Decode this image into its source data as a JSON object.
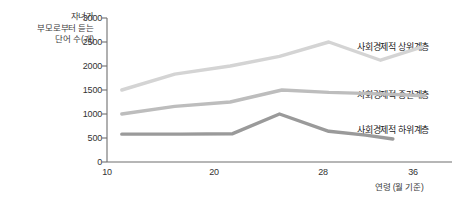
{
  "chart_data": {
    "type": "line",
    "title": "",
    "xlabel": "연령 (월 기준)",
    "ylabel": "자녀가\n부모로부터 듣는\n단어 수(개)",
    "xlim": [
      10,
      38
    ],
    "ylim": [
      0,
      3000
    ],
    "xticks": [
      "10",
      "20",
      "28",
      "36"
    ],
    "xtick_values": [
      10,
      20,
      28,
      36
    ],
    "yticks": [
      "0",
      "500",
      "1000",
      "1500",
      "2000",
      "2500",
      "3000"
    ],
    "ytick_values": [
      0,
      500,
      1000,
      1500,
      2000,
      2500,
      3000
    ],
    "grid": false,
    "legend_position": "right-inline",
    "series": [
      {
        "name": "사회경제적 상위계층",
        "color": "#d4d4d4",
        "x": [
          11.2,
          15.5,
          20.0,
          24.0,
          28.0,
          32.2,
          35.6
        ],
        "values": [
          1500,
          1830,
          2000,
          2200,
          2500,
          2120,
          2400
        ]
      },
      {
        "name": "사회경제적 중간계층",
        "color": "#bdbdbd",
        "x": [
          11.2,
          15.5,
          20.0,
          24.2,
          28.0,
          32.2,
          35.8
        ],
        "values": [
          1000,
          1160,
          1250,
          1500,
          1450,
          1420,
          1380
        ]
      },
      {
        "name": "사회경제적 하위계층",
        "color": "#9a9a9a",
        "x": [
          11.2,
          16.0,
          20.2,
          24.0,
          28.0,
          31.0,
          33.2
        ],
        "values": [
          580,
          580,
          590,
          1000,
          640,
          560,
          480
        ]
      }
    ]
  },
  "axes": {
    "y_title": "자녀가\n부모로부터 듣는\n단어 수(개)",
    "x_title": "연령 (월 기준)"
  },
  "y_ticks": [
    {
      "label": "3000"
    },
    {
      "label": "2500"
    },
    {
      "label": "2000"
    },
    {
      "label": "1500"
    },
    {
      "label": "1000"
    },
    {
      "label": "500"
    },
    {
      "label": "0"
    }
  ],
  "x_ticks": [
    {
      "label": "10"
    },
    {
      "label": "20"
    },
    {
      "label": "28"
    },
    {
      "label": "36"
    }
  ],
  "series_labels": [
    {
      "label": "사회경제적 상위계층"
    },
    {
      "label": "사회경제적 중간계층"
    },
    {
      "label": "사회경제적 하위계층"
    }
  ],
  "colors": {
    "upper": "#d4d4d4",
    "middle": "#bdbdbd",
    "lower": "#9a9a9a",
    "axis": "#6f6f6f",
    "text": "#333333",
    "background": "#ffffff"
  }
}
